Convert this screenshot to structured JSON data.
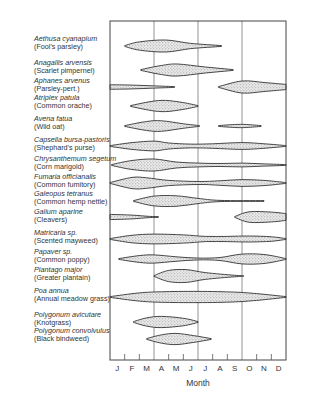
{
  "chart_data": {
    "type": "area",
    "title": "",
    "xlabel": "Month",
    "ylabel": "",
    "x_ticks": [
      "J",
      "F",
      "M",
      "A",
      "M",
      "J",
      "J",
      "A",
      "S",
      "O",
      "N",
      "D"
    ],
    "xlim": [
      0,
      12
    ],
    "grid": "vertical lines at quarter boundaries (end Mar, end Jun, end Sep)",
    "grid_months": [
      3,
      6,
      9
    ],
    "series": [
      {
        "name": "Aethusa cyanapium",
        "common": "(Fool's parsley)",
        "segments": [
          [
            [
              1,
              0
            ],
            [
              2,
              0.55
            ],
            [
              3.8,
              0.8
            ],
            [
              5.5,
              0.35
            ],
            [
              7.6,
              0.05
            ]
          ]
        ]
      },
      {
        "name": "Anagallis arvensis",
        "common": "(Scarlet pimpernel)",
        "segments": [
          [
            [
              2.1,
              0
            ],
            [
              3.5,
              0.6
            ],
            [
              4.6,
              0.8
            ],
            [
              6.5,
              0.4
            ],
            [
              8.4,
              0.05
            ]
          ]
        ]
      },
      {
        "name": "Aphanes arvenus",
        "common": "(Parsley-pert.)",
        "segments": [
          [
            [
              0,
              0.3
            ],
            [
              1.5,
              0.25
            ],
            [
              3,
              0.15
            ],
            [
              4.4,
              0.05
            ]
          ],
          [
            [
              7.4,
              0
            ],
            [
              9,
              0.8
            ],
            [
              10.5,
              0.6
            ],
            [
              12,
              0.35
            ]
          ]
        ]
      },
      {
        "name": "Atriplex patula",
        "common": "(Common orache)",
        "segments": [
          [
            [
              1.4,
              0
            ],
            [
              2.8,
              0.6
            ],
            [
              3.8,
              0.75
            ],
            [
              5,
              0.45
            ],
            [
              6,
              0.05
            ]
          ]
        ]
      },
      {
        "name": "Avena fatua",
        "common": "(Wild oat)",
        "segments": [
          [
            [
              1,
              0
            ],
            [
              2.5,
              0.6
            ],
            [
              3.5,
              0.7
            ],
            [
              5,
              0.3
            ],
            [
              6.1,
              0.05
            ]
          ],
          [
            [
              7.4,
              0
            ],
            [
              8.5,
              0.2
            ],
            [
              9.3,
              0.2
            ],
            [
              10.3,
              0
            ]
          ]
        ]
      },
      {
        "name": "Capsella bursa-pastoris",
        "common": "(Shephard's purse)",
        "segments": [
          [
            [
              0,
              0
            ],
            [
              1.5,
              0.45
            ],
            [
              3,
              0.65
            ],
            [
              4,
              0.4
            ],
            [
              5.5,
              0.25
            ],
            [
              7,
              0.3
            ],
            [
              9,
              0.45
            ],
            [
              10.5,
              0.3
            ],
            [
              12,
              0
            ]
          ]
        ]
      },
      {
        "name": "Chrysanthemum segetum",
        "common": "(Corn marigold)",
        "segments": [
          [
            [
              0.1,
              0
            ],
            [
              1.5,
              0.6
            ],
            [
              3,
              0.8
            ],
            [
              4.5,
              0.4
            ],
            [
              6,
              0.25
            ],
            [
              7.5,
              0.2
            ],
            [
              9,
              0.25
            ],
            [
              10.5,
              0.15
            ],
            [
              12,
              0.05
            ]
          ]
        ]
      },
      {
        "name": "Fumaria officianalis",
        "common": "(Common fumitory)",
        "segments": [
          [
            [
              0,
              0
            ],
            [
              1.5,
              0.75
            ],
            [
              2.5,
              0.7
            ],
            [
              4,
              0.35
            ],
            [
              6,
              0.2
            ],
            [
              7.5,
              0.3
            ],
            [
              9,
              0.45
            ],
            [
              10.5,
              0.35
            ],
            [
              12,
              0.05
            ]
          ]
        ]
      },
      {
        "name": "Galeopus tetranus",
        "common": "(Common hemp nettle)",
        "segments": [
          [
            [
              1.6,
              0
            ],
            [
              3,
              0.65
            ],
            [
              4.5,
              0.7
            ],
            [
              6,
              0.35
            ],
            [
              7.5,
              0.08
            ],
            [
              10.5,
              0.02
            ]
          ]
        ]
      },
      {
        "name": "Galium aparine",
        "common": "(Cleavers)",
        "segments": [
          [
            [
              0,
              0.35
            ],
            [
              1.5,
              0.25
            ],
            [
              2.7,
              0.08
            ],
            [
              3.3,
              0.02
            ]
          ],
          [
            [
              8.5,
              0
            ],
            [
              9.5,
              0.7
            ],
            [
              11,
              0.65
            ],
            [
              12,
              0.45
            ]
          ]
        ]
      },
      {
        "name": "Matricaria sp.",
        "common": "(Scented mayweed)",
        "segments": [
          [
            [
              0,
              0
            ],
            [
              1.5,
              0.5
            ],
            [
              3,
              0.65
            ],
            [
              5,
              0.55
            ],
            [
              6.5,
              0.35
            ],
            [
              8,
              0.35
            ],
            [
              9.5,
              0.4
            ],
            [
              11,
              0.3
            ],
            [
              12,
              0.05
            ]
          ]
        ]
      },
      {
        "name": "Papaver sp.",
        "common": "(Common poppy)",
        "segments": [
          [
            [
              0.6,
              0
            ],
            [
              2,
              0.45
            ],
            [
              3,
              0.55
            ],
            [
              4.5,
              0.3
            ],
            [
              6,
              0.12
            ],
            [
              7.5,
              0.2
            ],
            [
              9,
              0.65
            ],
            [
              10.5,
              0.6
            ],
            [
              12,
              0.05
            ]
          ]
        ]
      },
      {
        "name": "Plantago major",
        "common": "(Greater plantain)",
        "segments": [
          [
            [
              3,
              0
            ],
            [
              4,
              0.75
            ],
            [
              5.2,
              0.85
            ],
            [
              6.5,
              0.45
            ],
            [
              8.5,
              0.1
            ],
            [
              9.1,
              0.05
            ]
          ]
        ]
      },
      {
        "name": "Poa annua",
        "common": "(Annual meadow grass)",
        "segments": [
          [
            [
              0,
              0
            ],
            [
              2,
              0.55
            ],
            [
              3.5,
              0.7
            ],
            [
              6,
              0.75
            ],
            [
              8.5,
              0.65
            ],
            [
              10,
              0.45
            ],
            [
              12,
              0
            ]
          ]
        ]
      },
      {
        "name": "Polygonum avicutare",
        "common": "(Knotgrass)",
        "segments": [
          [
            [
              1.6,
              0
            ],
            [
              2.5,
              0.55
            ],
            [
              3.5,
              0.75
            ],
            [
              5,
              0.5
            ],
            [
              6,
              0.05
            ]
          ]
        ]
      },
      {
        "name": "Polygonum convolvulus",
        "common": "(Black bindweed)",
        "segments": [
          [
            [
              2.5,
              0
            ],
            [
              3.5,
              0.55
            ],
            [
              4.5,
              0.75
            ],
            [
              5.7,
              0.45
            ],
            [
              6.9,
              0.05
            ]
          ]
        ]
      }
    ]
  }
}
